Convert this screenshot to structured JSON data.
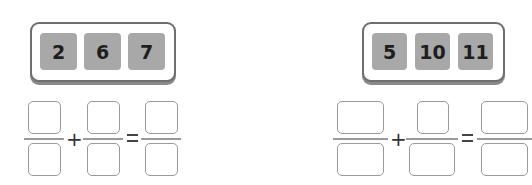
{
  "problems": [
    {
      "cards": [
        "2",
        "6",
        "7"
      ],
      "operator": "+",
      "equals": "="
    },
    {
      "cards": [
        "5",
        "10",
        "11"
      ],
      "operator": "+",
      "equals": "="
    }
  ],
  "colors": {
    "card": "#a8a8a8",
    "border": "#6e6e6e",
    "answer_box": "#9a9a9a"
  }
}
